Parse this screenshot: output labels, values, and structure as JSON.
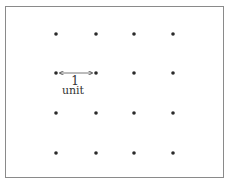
{
  "diagram": {
    "type": "dot-lattice",
    "rows": 4,
    "columns": 4,
    "dot_color": "#2a2a2a",
    "border_color": "#8a8a8a",
    "dots_x": [
      56,
      96,
      134,
      173
    ],
    "dots_y": [
      34,
      73,
      113,
      153
    ],
    "measure": {
      "number": "1",
      "unit": "unit",
      "from": {
        "row": 1,
        "col": 0
      },
      "to": {
        "row": 1,
        "col": 1
      }
    }
  }
}
